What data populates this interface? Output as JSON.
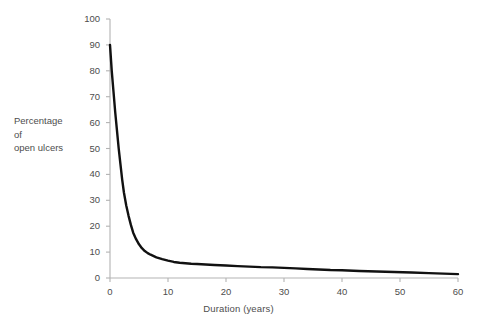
{
  "chart_data": {
    "type": "line",
    "title": "",
    "xlabel": "Duration (years)",
    "ylabel": "Percentage of open ulcers",
    "ylabel_lines": [
      "Percentage",
      "of",
      "open ulcers"
    ],
    "xlim": [
      0,
      60
    ],
    "ylim": [
      0,
      100
    ],
    "xticks": [
      0,
      10,
      20,
      30,
      40,
      50,
      60
    ],
    "yticks": [
      0,
      10,
      20,
      30,
      40,
      50,
      60,
      70,
      80,
      90,
      100
    ],
    "xtick_labels": [
      "0",
      "10",
      "20",
      "30",
      "40",
      "50",
      "60"
    ],
    "ytick_labels": [
      "0",
      "10",
      "20",
      "30",
      "40",
      "50",
      "60",
      "70",
      "80",
      "90",
      "100"
    ],
    "grid": false,
    "legend": null,
    "series": [
      {
        "name": "Percentage of open ulcers",
        "color": "#111111",
        "line_width": 2.4,
        "x": [
          0,
          0.3,
          0.6,
          0.9,
          1.2,
          1.5,
          1.8,
          2.1,
          2.4,
          2.8,
          3.2,
          3.6,
          4.0,
          4.5,
          5.0,
          5.5,
          6.0,
          6.5,
          7.0,
          8.0,
          9.0,
          10.0,
          11.0,
          12.0,
          13.0,
          14.0,
          15.0,
          16.5,
          18.0,
          20.0,
          22.0,
          24.0,
          26.0,
          28.0,
          30.0,
          32.0,
          34.0,
          36.0,
          38.0,
          40.0,
          43.0,
          46.0,
          49.0,
          52.0,
          55.0,
          57.5,
          60.0
        ],
        "y": [
          90,
          80,
          72,
          64,
          57,
          50,
          44,
          38,
          33,
          28,
          24,
          20.5,
          17.5,
          15,
          13,
          11.5,
          10.4,
          9.6,
          9,
          8,
          7.3,
          6.7,
          6.2,
          5.9,
          5.7,
          5.5,
          5.4,
          5.2,
          5.0,
          4.8,
          4.6,
          4.4,
          4.2,
          4.1,
          3.9,
          3.7,
          3.5,
          3.3,
          3.1,
          3.0,
          2.7,
          2.5,
          2.3,
          2.1,
          1.9,
          1.7,
          1.5
        ]
      }
    ],
    "axis_color": "#b3b3b3",
    "tick_color": "#b3b3b3",
    "label_color": "#4d4d4d",
    "background": "#ffffff"
  },
  "geometry": {
    "plot_left": 110,
    "plot_right": 458,
    "plot_top": 19,
    "plot_bottom": 278
  }
}
